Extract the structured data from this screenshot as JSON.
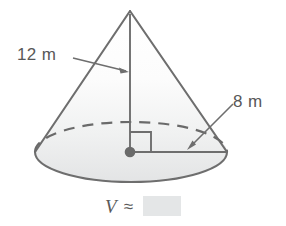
{
  "figure": {
    "shape_name": "cone",
    "title": "",
    "stroke_color": "#6e6e6e",
    "fill_top_color": "#fbfbfb",
    "fill_bottom_color": "#e9eaea",
    "base_fill_color": "#e6e7e8",
    "dashed_arc_name": "hidden-base-edge",
    "center_dot_name": "base-center-point",
    "right_angle_name": "right-angle-marker"
  },
  "labels": {
    "height": {
      "text": "12 m",
      "value": 12,
      "unit": "m",
      "measures": "height"
    },
    "radius": {
      "text": "8 m",
      "value": 8,
      "unit": "m",
      "measures": "radius"
    }
  },
  "volume": {
    "symbol": "V",
    "approx_sign": "≈",
    "answer": "",
    "answer_placeholder": ""
  }
}
